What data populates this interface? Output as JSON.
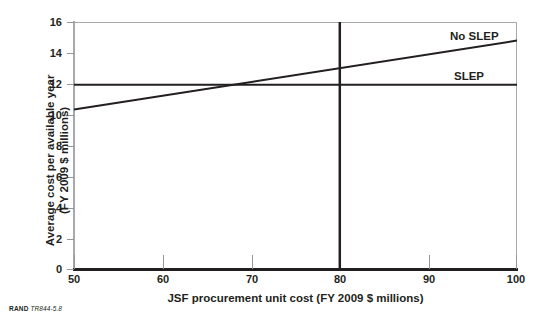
{
  "figure": {
    "source_note_brand": "RAND",
    "source_note_code": "TR844-5.8"
  },
  "chart_data": {
    "type": "line",
    "title": "",
    "xlabel": "JSF procurement unit cost (FY 2009 $ millions)",
    "ylabel_line1": "Average cost per available year",
    "ylabel_line2": "(FY 2009 $ millions)",
    "xlim": [
      50,
      100
    ],
    "ylim": [
      0,
      16
    ],
    "xticks": [
      50,
      60,
      70,
      80,
      90,
      100
    ],
    "yticks": [
      0,
      2,
      4,
      6,
      8,
      10,
      12,
      14,
      16
    ],
    "grid": false,
    "legend_position": "inline-right",
    "series": [
      {
        "name": "No SLEP",
        "label": "No SLEP",
        "x": [
          50,
          100
        ],
        "values": [
          10.35,
          14.8
        ],
        "color": "#231f20",
        "width": 2
      },
      {
        "name": "SLEP",
        "label": "SLEP",
        "x": [
          50,
          100
        ],
        "values": [
          11.95,
          11.95
        ],
        "color": "#231f20",
        "width": 2
      }
    ],
    "annotations": [
      {
        "name": "reference-line-80",
        "type": "vline",
        "x": 80,
        "color": "#231f20",
        "width": 2.5
      }
    ]
  }
}
